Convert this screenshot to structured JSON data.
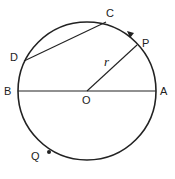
{
  "diagram": {
    "title": "",
    "type": "circle-geometry",
    "colors": {
      "stroke": "#222222",
      "background": "#ffffff"
    },
    "circle": {
      "center_label": "O",
      "radius_label": "r"
    },
    "points": [
      {
        "id": "A",
        "label": "A"
      },
      {
        "id": "B",
        "label": "B"
      },
      {
        "id": "C",
        "label": "C"
      },
      {
        "id": "D",
        "label": "D"
      },
      {
        "id": "P",
        "label": "P"
      },
      {
        "id": "Q",
        "label": "Q"
      },
      {
        "id": "O",
        "label": "O"
      }
    ],
    "segments": [
      "AB (diameter)",
      "OP (radius r)",
      "CD (chord)"
    ],
    "arrow": {
      "location": "arc between C and P",
      "direction": "counterclockwise"
    }
  }
}
